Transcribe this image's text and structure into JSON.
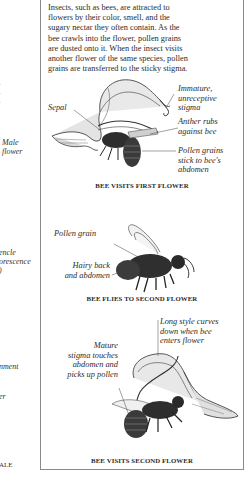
{
  "left_fragments": {
    "male_flower": "Male\nflower",
    "inflorescence": "encle\norescence\n)",
    "ment": "nment",
    "er": "er",
    "ale": "ALE"
  },
  "intro_text": {
    "lines": [
      "Insects, such as bees, are attracted to",
      "flowers by their color, smell, and the",
      "sugary nectar they often contain. As the",
      "bee crawls into the flower, pollen grains",
      "are dusted onto it. When the insect visits",
      "another flower of the same species, pollen",
      "grains are transferred to the sticky stigma."
    ]
  },
  "panel1": {
    "caption": "BEE VISITS FIRST FLOWER",
    "labels": {
      "sepal": "Sepal",
      "stigma": "Immature,\nunreceptive\nstigma",
      "anther": "Anther rubs\nagainst bee",
      "pollen": "Pollen grains\nstick to bee's\nabdomen"
    }
  },
  "panel2": {
    "caption": "BEE FLIES TO SECOND FLOWER",
    "labels": {
      "pollen_grain": "Pollen grain",
      "hairy": "Hairy back\nand abdomen"
    }
  },
  "panel3": {
    "caption": "BEE VISITS SECOND FLOWER",
    "labels": {
      "style": "Long style curves\ndown when bee\nenters flower",
      "mature": "Mature\nstigma touches\nabdomen and\npicks up pollen"
    }
  }
}
